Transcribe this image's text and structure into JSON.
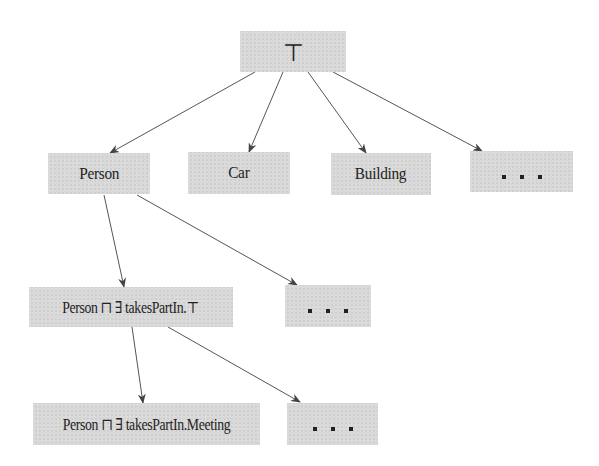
{
  "diagram": {
    "type": "concept-hierarchy",
    "colors": {
      "node_fill": "#d9d9d9",
      "edge": "#555555",
      "text": "#222222",
      "background": "#ffffff"
    },
    "nodes": {
      "top": {
        "label": "⊤",
        "box": [
          240,
          31,
          106,
          41
        ]
      },
      "person": {
        "label": "Person",
        "box": [
          48,
          153,
          102,
          41
        ]
      },
      "car": {
        "label": "Car",
        "box": [
          188,
          152,
          102,
          42
        ]
      },
      "building": {
        "label": "Building",
        "box": [
          331,
          153,
          100,
          42
        ]
      },
      "more_level1": {
        "label": ". . .",
        "box": [
          470,
          151,
          103,
          41
        ]
      },
      "person_takes_part_in_top": {
        "label": "Person ⊓ ∃ takesPartIn.⊤",
        "box": [
          29,
          287,
          204,
          40
        ]
      },
      "more_level2": {
        "label": ". . .",
        "box": [
          285,
          285,
          86,
          42
        ]
      },
      "person_takes_part_in_meeting": {
        "label": "Person ⊓ ∃ takesPartIn.Meeting",
        "box": [
          33,
          403,
          227,
          42
        ]
      },
      "more_level3": {
        "label": ". . .",
        "box": [
          287,
          403,
          91,
          42
        ]
      }
    },
    "edges": [
      {
        "from": "top",
        "to": "person",
        "x1": 255,
        "y1": 72,
        "x2": 110,
        "y2": 153
      },
      {
        "from": "top",
        "to": "car",
        "x1": 283,
        "y1": 72,
        "x2": 249,
        "y2": 152
      },
      {
        "from": "top",
        "to": "building",
        "x1": 308,
        "y1": 72,
        "x2": 366,
        "y2": 153
      },
      {
        "from": "top",
        "to": "more_level1",
        "x1": 333,
        "y1": 72,
        "x2": 482,
        "y2": 151
      },
      {
        "from": "person",
        "to": "person_takes_part_in_top",
        "x1": 104,
        "y1": 195,
        "x2": 124,
        "y2": 287
      },
      {
        "from": "person",
        "to": "more_level2",
        "x1": 137,
        "y1": 195,
        "x2": 297,
        "y2": 285
      },
      {
        "from": "person_takes_part_in_top",
        "to": "person_takes_part_in_meeting",
        "x1": 132,
        "y1": 327,
        "x2": 143,
        "y2": 403
      },
      {
        "from": "person_takes_part_in_top",
        "to": "more_level3",
        "x1": 168,
        "y1": 327,
        "x2": 300,
        "y2": 402
      }
    ]
  }
}
